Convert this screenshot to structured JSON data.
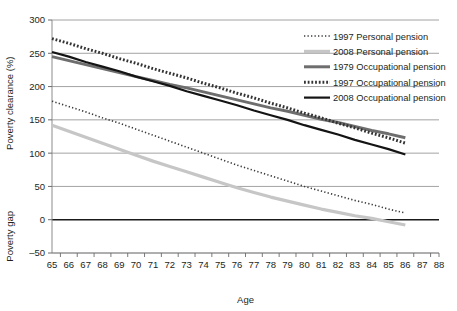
{
  "chart_data": {
    "type": "line",
    "title": "",
    "xlabel": "Age",
    "ylabel_upper": "Poverty clearance (%)",
    "ylabel_lower": "Poverty gap",
    "xlim": [
      65,
      88
    ],
    "ylim": [
      -50,
      300
    ],
    "yticks": [
      300,
      250,
      200,
      150,
      100,
      50,
      0,
      -50
    ],
    "ytick_labels": [
      "300",
      "250",
      "200",
      "150",
      "100",
      "50",
      "0",
      "–50"
    ],
    "xticks": [
      65,
      66,
      67,
      68,
      69,
      70,
      71,
      72,
      73,
      74,
      75,
      76,
      77,
      78,
      79,
      80,
      81,
      82,
      83,
      84,
      85,
      86,
      87,
      88
    ],
    "xtick_labels": [
      "65",
      "66",
      "67",
      "68",
      "69",
      "70",
      "71",
      "72",
      "73",
      "74",
      "75",
      "76",
      "77",
      "78",
      "79",
      "80",
      "81",
      "82",
      "83",
      "84",
      "85",
      "86",
      "87",
      "88"
    ],
    "grid": true,
    "zero_line": true,
    "legend_position": "top-right",
    "x": [
      65,
      66,
      67,
      68,
      69,
      70,
      71,
      72,
      73,
      74,
      75,
      76,
      77,
      78,
      79,
      80,
      81,
      82,
      83,
      84,
      85,
      86
    ],
    "series": [
      {
        "name": "1997 Personal pension",
        "style": "dotted",
        "color": "#3a3a3a",
        "width": 1.6,
        "values": [
          178,
          170,
          162,
          153,
          145,
          136,
          127,
          118,
          109,
          100,
          91,
          82,
          74,
          66,
          58,
          50,
          43,
          36,
          29,
          23,
          16,
          10
        ]
      },
      {
        "name": "2008 Personal pension",
        "style": "solid",
        "color": "#c6c6c6",
        "width": 3.2,
        "values": [
          142,
          133,
          124,
          115,
          106,
          97,
          88,
          80,
          72,
          64,
          56,
          48,
          41,
          34,
          28,
          22,
          16,
          11,
          6,
          2,
          -3,
          -8
        ]
      },
      {
        "name": "1979 Occupational pension",
        "style": "solid",
        "color": "#6e6e6e",
        "width": 3.0,
        "values": [
          245,
          239,
          233,
          227,
          221,
          215,
          209,
          203,
          198,
          192,
          186,
          180,
          174,
          168,
          163,
          157,
          151,
          146,
          140,
          134,
          129,
          123
        ]
      },
      {
        "name": "1997 Occupational pension",
        "style": "dashed",
        "color": "#333333",
        "width": 3.0,
        "values": [
          272,
          265,
          257,
          250,
          242,
          235,
          227,
          220,
          213,
          205,
          198,
          190,
          183,
          175,
          168,
          160,
          153,
          145,
          138,
          130,
          123,
          115
        ]
      },
      {
        "name": "2008 Occupational pension",
        "style": "solid",
        "color": "#141414",
        "width": 2.2,
        "values": [
          252,
          245,
          237,
          230,
          223,
          215,
          208,
          201,
          193,
          186,
          179,
          172,
          164,
          157,
          150,
          142,
          135,
          128,
          120,
          113,
          106,
          98
        ]
      }
    ]
  },
  "legend": {
    "items": [
      {
        "label": "1997 Personal pension"
      },
      {
        "label": "2008 Personal pension"
      },
      {
        "label": "1979 Occupational pension"
      },
      {
        "label": "1997 Occupational pension"
      },
      {
        "label": "2008 Occupational pension"
      }
    ]
  }
}
